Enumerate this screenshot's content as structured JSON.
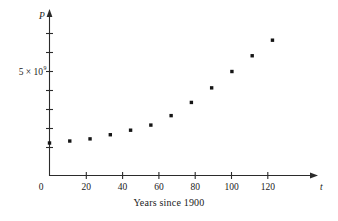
{
  "chart_data": {
    "type": "scatter",
    "title": "",
    "subtitle": "",
    "caption": "Years since 1900",
    "xlabel": "t",
    "ylabel": "P",
    "x": [
      0,
      10,
      20,
      30,
      40,
      50,
      60,
      70,
      80,
      90,
      100,
      110
    ],
    "values": [
      1650000000,
      1750000000,
      1860000000,
      2070000000,
      2300000000,
      2560000000,
      3040000000,
      3710000000,
      4450000000,
      5280000000,
      6080000000,
      6870000000
    ],
    "xlim": [
      0,
      130
    ],
    "ylim": [
      0,
      8200000000
    ],
    "xticks": [
      0,
      20,
      40,
      60,
      80,
      100,
      120
    ],
    "xtick_labels": [
      "0",
      "20",
      "40",
      "60",
      "80",
      "100",
      "120"
    ],
    "yticks": [
      1250000000,
      2500000000,
      3750000000,
      5000000000,
      6250000000,
      7500000000
    ],
    "ytick_labels": [
      "",
      "",
      "",
      "5 × 10⁹",
      "",
      ""
    ],
    "y_labeled_tick": 5000000000,
    "y_labeled_text": "5 × 10",
    "y_labeled_exponent": "9",
    "grid": false,
    "legend": null,
    "series_name": "World population",
    "point_color": "#151515",
    "axis_color": "#2b2b2b",
    "background_color": "#ffffff"
  },
  "axes": {
    "y_axis_name": "P",
    "x_axis_name": "t",
    "origin_label": "0"
  },
  "caption": {
    "text": "Years since 1900"
  }
}
